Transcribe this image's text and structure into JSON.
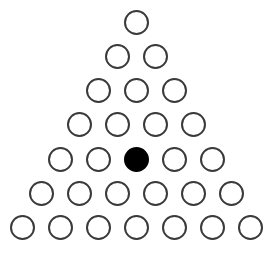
{
  "game": {
    "name": "triangular peg board",
    "rows": 7,
    "colors": {
      "empty_stroke": "#3a3a3a",
      "empty_fill": "#ffffff",
      "peg_fill": "#000000"
    },
    "board": [
      [
        "empty"
      ],
      [
        "empty",
        "empty"
      ],
      [
        "empty",
        "empty",
        "empty"
      ],
      [
        "empty",
        "empty",
        "empty",
        "empty"
      ],
      [
        "empty",
        "empty",
        "peg",
        "empty",
        "empty"
      ],
      [
        "empty",
        "empty",
        "empty",
        "empty",
        "empty",
        "empty"
      ],
      [
        "empty",
        "empty",
        "empty",
        "empty",
        "empty",
        "empty",
        "empty"
      ]
    ]
  }
}
